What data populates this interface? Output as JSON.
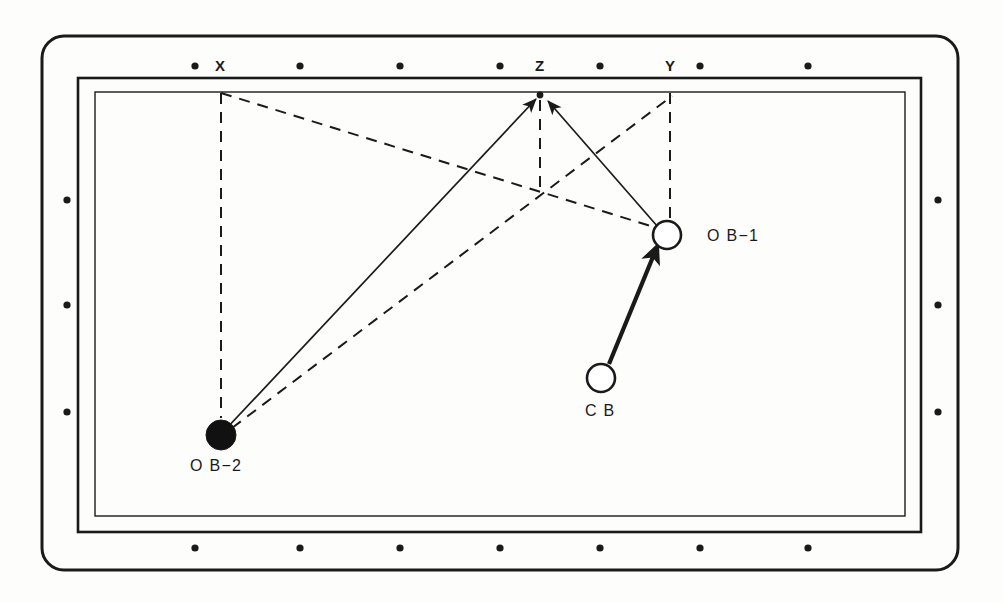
{
  "diagram": {
    "type": "pool-table-shot-diagram",
    "colors": {
      "ink": "#1a1a1a",
      "cloth": "#fdfdfb",
      "rail": "#fdfdfb",
      "ball_fill_white": "#ffffff",
      "ball_fill_black": "#111111"
    },
    "table": {
      "outer_frame": {
        "x": 42,
        "y": 36,
        "w": 916,
        "h": 534,
        "radius": 22,
        "stroke": 3
      },
      "rail_rect": {
        "x": 78,
        "y": 78,
        "w": 843,
        "h": 454,
        "stroke": 2.6
      },
      "cloth_rect": {
        "x": 95,
        "y": 92,
        "w": 810,
        "h": 424,
        "stroke": 1.4
      }
    },
    "rail_markers": {
      "top": {
        "y": 66,
        "x": [
          195,
          300,
          400,
          500,
          600,
          700,
          808
        ]
      },
      "bottom": {
        "y": 548,
        "x": [
          195,
          300,
          400,
          500,
          600,
          700,
          808
        ]
      },
      "left": {
        "x": 67,
        "y": [
          200,
          305,
          412
        ]
      },
      "right": {
        "x": 938,
        "y": [
          200,
          305,
          412
        ]
      }
    },
    "rail_labels": [
      {
        "name": "rail-label-x",
        "text": "X",
        "x": 215,
        "y": 58
      },
      {
        "name": "rail-label-z",
        "text": "Z",
        "x": 535,
        "y": 58
      },
      {
        "name": "rail-label-y",
        "text": "Y",
        "x": 665,
        "y": 58
      }
    ],
    "balls": [
      {
        "name": "object-ball-1",
        "label": "O B−1",
        "kind": "white",
        "cx": 667,
        "cy": 235,
        "r": 14,
        "label_x": 707,
        "label_y": 228
      },
      {
        "name": "object-ball-2",
        "label": "O B−2",
        "kind": "black",
        "cx": 221,
        "cy": 435,
        "r": 15,
        "label_x": 190,
        "label_y": 458
      },
      {
        "name": "cue-ball",
        "label": "C B",
        "kind": "white",
        "cx": 601,
        "cy": 378,
        "r": 14,
        "label_x": 585,
        "label_y": 403
      }
    ],
    "aim_point": {
      "name": "target-point-z",
      "x": 540,
      "y": 95,
      "r": 3.4
    },
    "crossing_point": {
      "name": "dashed-line-crossing",
      "x": 540,
      "y": 193
    },
    "solid_paths": [
      {
        "name": "path-ob2-to-z-double-arrow",
        "from": {
          "x": 225,
          "y": 430
        },
        "to": {
          "x": 536,
          "y": 99
        },
        "arrow_start": true,
        "arrow_end": true,
        "stroke": 1.7
      },
      {
        "name": "path-ob1-to-z-arrow",
        "from": {
          "x": 658,
          "y": 227
        },
        "to": {
          "x": 548,
          "y": 101
        },
        "arrow_start": false,
        "arrow_end": true,
        "stroke": 1.7
      },
      {
        "name": "path-cb-to-ob1-thick-arrow",
        "from": {
          "x": 609,
          "y": 364
        },
        "to": {
          "x": 657,
          "y": 247
        },
        "arrow_start": false,
        "arrow_end": true,
        "stroke": 4.2
      }
    ],
    "dashed_paths": [
      {
        "name": "dash-x-vertical-to-ob2",
        "x1": 221,
        "y1": 93,
        "x2": 221,
        "y2": 418
      },
      {
        "name": "dash-x-to-ob1-diagonal",
        "x1": 221,
        "y1": 93,
        "x2": 657,
        "y2": 228
      },
      {
        "name": "dash-ob2-to-y-diagonal",
        "x1": 232,
        "y1": 428,
        "x2": 672,
        "y2": 96
      },
      {
        "name": "dash-y-vertical-to-ob1",
        "x1": 670,
        "y1": 93,
        "x2": 670,
        "y2": 221
      },
      {
        "name": "dash-z-vertical-down",
        "x1": 540,
        "y1": 100,
        "x2": 540,
        "y2": 196
      }
    ]
  }
}
